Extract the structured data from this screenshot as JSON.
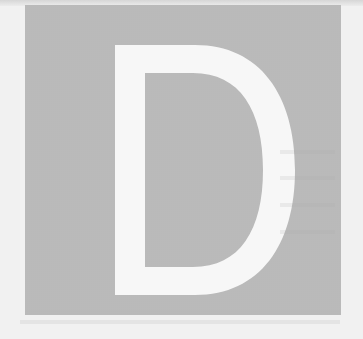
{
  "drop_cap": {
    "letter": "D",
    "letter_color": "#f7f7f7",
    "box_color": "#c9c9c9",
    "page_color": "#f1f1f1"
  }
}
